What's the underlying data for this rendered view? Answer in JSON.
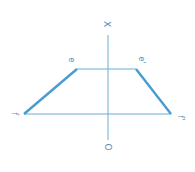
{
  "diagram": {
    "type": "orthographic projection (trapezoid)",
    "rotation_deg": 90,
    "colors": {
      "line": "#4a9bd0",
      "thin_line": "#6aaed8",
      "label": "#5a8fb8",
      "background": "#ffffff"
    },
    "axis": {
      "top_label": "X",
      "bottom_label": "O"
    },
    "vertices": {
      "e": "e",
      "e_prime": "e'",
      "f": "f",
      "f_prime": "f'"
    }
  }
}
